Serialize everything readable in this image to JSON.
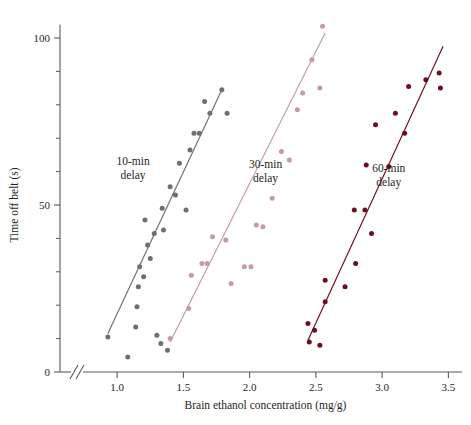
{
  "chart_data": {
    "type": "scatter",
    "title": "",
    "xlabel": "Brain ethanol concentration (mg/g)",
    "ylabel": "Time off belt (s)",
    "xlim": [
      0.78,
      3.55
    ],
    "ylim": [
      0,
      108
    ],
    "x_ticks": [
      1.0,
      1.5,
      2.0,
      2.5,
      3.0,
      3.5
    ],
    "x_tick_labels": [
      "1.0",
      "1.5",
      "2.0",
      "2.5",
      "3.0",
      "3.5"
    ],
    "y_ticks": [
      0,
      50,
      100
    ],
    "y_tick_labels": [
      "0",
      "50",
      "100"
    ],
    "y_minor_ticks": [
      10,
      20,
      30,
      40,
      60,
      70,
      80,
      90
    ],
    "grid": false,
    "axis_break": {
      "present": true,
      "axis": "x",
      "label": "//"
    },
    "legend_position": "inline-annotations",
    "series": [
      {
        "name": "10-min delay",
        "label": "10-min\ndelay",
        "color": "#6f6f72",
        "marker": "circle",
        "label_x": 1.12,
        "label_y": 62,
        "fit_line": {
          "x1": 0.93,
          "y1": 11.5,
          "x2": 1.79,
          "y2": 84.5
        },
        "points": [
          {
            "x": 0.93,
            "y": 10.5
          },
          {
            "x": 1.08,
            "y": 4.5
          },
          {
            "x": 1.14,
            "y": 13.5
          },
          {
            "x": 1.15,
            "y": 19.5
          },
          {
            "x": 1.16,
            "y": 25.5
          },
          {
            "x": 1.17,
            "y": 31.5
          },
          {
            "x": 1.2,
            "y": 28.5
          },
          {
            "x": 1.21,
            "y": 45.5
          },
          {
            "x": 1.23,
            "y": 38.0
          },
          {
            "x": 1.25,
            "y": 34.0
          },
          {
            "x": 1.28,
            "y": 41.5
          },
          {
            "x": 1.3,
            "y": 11.0
          },
          {
            "x": 1.33,
            "y": 8.5
          },
          {
            "x": 1.34,
            "y": 49.0
          },
          {
            "x": 1.35,
            "y": 42.5
          },
          {
            "x": 1.38,
            "y": 6.5
          },
          {
            "x": 1.4,
            "y": 55.5
          },
          {
            "x": 1.44,
            "y": 53.0
          },
          {
            "x": 1.47,
            "y": 62.5
          },
          {
            "x": 1.52,
            "y": 48.5
          },
          {
            "x": 1.55,
            "y": 66.5
          },
          {
            "x": 1.58,
            "y": 71.5
          },
          {
            "x": 1.62,
            "y": 71.5
          },
          {
            "x": 1.66,
            "y": 81.0
          },
          {
            "x": 1.7,
            "y": 77.5
          },
          {
            "x": 1.79,
            "y": 84.5
          },
          {
            "x": 1.83,
            "y": 77.5
          }
        ]
      },
      {
        "name": "30-min delay",
        "label": "30-min\ndelay",
        "color": "#c49aa8",
        "marker": "circle",
        "label_x": 2.12,
        "label_y": 61,
        "fit_line": {
          "x1": 1.4,
          "y1": 9.0,
          "x2": 2.57,
          "y2": 101.5
        },
        "points": [
          {
            "x": 1.4,
            "y": 10.0
          },
          {
            "x": 1.54,
            "y": 19.0
          },
          {
            "x": 1.56,
            "y": 29.0
          },
          {
            "x": 1.64,
            "y": 32.5
          },
          {
            "x": 1.68,
            "y": 32.5
          },
          {
            "x": 1.72,
            "y": 40.5
          },
          {
            "x": 1.82,
            "y": 39.5
          },
          {
            "x": 1.86,
            "y": 26.5
          },
          {
            "x": 1.96,
            "y": 31.5
          },
          {
            "x": 2.01,
            "y": 31.5
          },
          {
            "x": 2.05,
            "y": 44.0
          },
          {
            "x": 2.1,
            "y": 43.5
          },
          {
            "x": 2.17,
            "y": 52.0
          },
          {
            "x": 2.24,
            "y": 66.0
          },
          {
            "x": 2.3,
            "y": 63.5
          },
          {
            "x": 2.36,
            "y": 78.5
          },
          {
            "x": 2.4,
            "y": 83.5
          },
          {
            "x": 2.47,
            "y": 93.5
          },
          {
            "x": 2.55,
            "y": 103.5
          },
          {
            "x": 2.53,
            "y": 85.0
          }
        ]
      },
      {
        "name": "60-min delay",
        "label": "60-min\ndelay",
        "color": "#6b0f1f",
        "marker": "circle",
        "label_x": 3.05,
        "label_y": 60,
        "fit_line": {
          "x1": 2.44,
          "y1": 9.5,
          "x2": 3.46,
          "y2": 97.5
        },
        "points": [
          {
            "x": 2.44,
            "y": 14.5
          },
          {
            "x": 2.45,
            "y": 9.0
          },
          {
            "x": 2.49,
            "y": 12.5
          },
          {
            "x": 2.53,
            "y": 8.0
          },
          {
            "x": 2.57,
            "y": 27.5
          },
          {
            "x": 2.57,
            "y": 21.0
          },
          {
            "x": 2.72,
            "y": 25.5
          },
          {
            "x": 2.79,
            "y": 48.5
          },
          {
            "x": 2.8,
            "y": 32.5
          },
          {
            "x": 2.87,
            "y": 48.5
          },
          {
            "x": 2.88,
            "y": 62.0
          },
          {
            "x": 2.92,
            "y": 41.5
          },
          {
            "x": 2.95,
            "y": 74.0
          },
          {
            "x": 3.05,
            "y": 61.5
          },
          {
            "x": 3.1,
            "y": 77.5
          },
          {
            "x": 3.17,
            "y": 71.5
          },
          {
            "x": 3.2,
            "y": 85.5
          },
          {
            "x": 3.33,
            "y": 87.5
          },
          {
            "x": 3.43,
            "y": 89.5
          },
          {
            "x": 3.44,
            "y": 85.0
          }
        ]
      }
    ]
  },
  "axis": {
    "tick_labels_x": [
      "1.0",
      "1.5",
      "2.0",
      "2.5",
      "3.0",
      "3.5"
    ],
    "tick_labels_y": [
      "0",
      "50",
      "100"
    ],
    "xlabel": "Brain ethanol concentration (mg/g)",
    "ylabel": "Time off belt (s)"
  },
  "annotations": {
    "s1_line1": "10-min",
    "s1_line2": "delay",
    "s2_line1": "30-min",
    "s2_line2": "delay",
    "s3_line1": "60-min",
    "s3_line2": "delay"
  },
  "colors": {
    "series_10min": "#6f6f72",
    "series_30min": "#c49aa8",
    "series_60min": "#6b0f1f",
    "axis": "#58595b",
    "text": "#231f20",
    "background": "#ffffff"
  }
}
